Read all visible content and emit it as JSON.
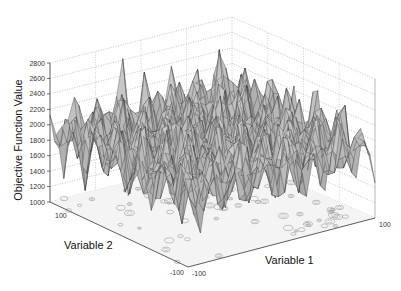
{
  "chart_data": {
    "type": "surface3d",
    "title": "",
    "xlabel": "Variable 1",
    "ylabel": "Variable 2",
    "zlabel": "Objective Function Value",
    "xlim": [
      -100,
      100
    ],
    "ylim": [
      -100,
      100
    ],
    "zlim": [
      1000,
      2800
    ],
    "z_ticks": [
      1000,
      1200,
      1400,
      1600,
      1800,
      2000,
      2200,
      2400,
      2600,
      2800
    ],
    "x_tick_labels": [
      "-100",
      "100"
    ],
    "y_tick_labels": [
      "100",
      "-100"
    ],
    "grid": true,
    "colormap": "grayscale",
    "floor_contours": true,
    "surface_description": "Highly multimodal rugged surface with many peaks and valleys; values mostly between ~1200 and ~2600",
    "approx_peak_max": 2600,
    "approx_valley_min": 1150
  },
  "labels": {
    "z_axis": "Objective Function Value",
    "x_axis": "Variable 1",
    "y_axis": "Variable 2",
    "x_min": "-100",
    "x_max": "100",
    "y_min": "-100",
    "y_max": "100"
  }
}
